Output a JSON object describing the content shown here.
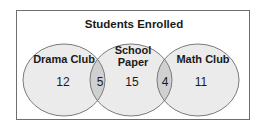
{
  "diagram": {
    "title": "Students Enrolled",
    "sets": [
      {
        "name": "Drama Club",
        "only_count": "12"
      },
      {
        "name_line1": "School",
        "name_line2": "Paper",
        "only_count": "15"
      },
      {
        "name": "Math Club",
        "only_count": "11"
      }
    ],
    "intersections": {
      "drama_school": "5",
      "school_math": "4"
    },
    "colors": {
      "circle_fill": "#ebebeb",
      "overlap_fill": "#d0d0d0",
      "circle_stroke": "#7a7a7a",
      "frame_stroke": "#6e6e6e"
    }
  }
}
